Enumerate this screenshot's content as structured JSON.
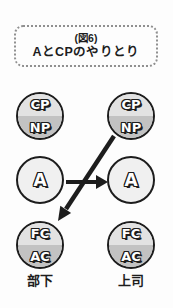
{
  "figure": {
    "caption_line1": "(図6)",
    "caption_line2": "AとCPのやりとり"
  },
  "left_person": {
    "label": "部下",
    "top_circle": {
      "upper": "CP",
      "lower": "NP"
    },
    "middle_circle": {
      "letter": "A"
    },
    "bottom_circle": {
      "upper": "FC",
      "lower": "AC"
    }
  },
  "right_person": {
    "label": "上司",
    "top_circle": {
      "upper": "CP",
      "lower": "NP"
    },
    "middle_circle": {
      "letter": "A"
    },
    "bottom_circle": {
      "upper": "FC",
      "lower": "AC"
    }
  },
  "arrows": [
    {
      "name": "a-to-a",
      "from": "部下 A",
      "to": "上司 A",
      "direction": "right"
    },
    {
      "name": "cp-to-ac",
      "from": "上司 CP/NP",
      "to": "部下 FC/AC",
      "direction": "down-left"
    }
  ],
  "colors": {
    "background": "#fdfdfd",
    "ink": "#1d1d1d",
    "box_border": "#909090",
    "half_light": "#e2e2e2",
    "half_dark": "#c2c2c2",
    "a_fill": "#f0f0f0"
  }
}
